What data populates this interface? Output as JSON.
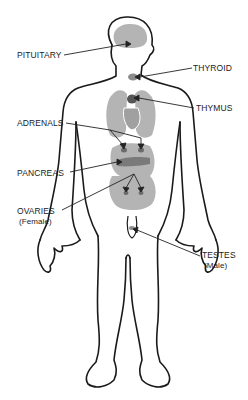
{
  "diagram": {
    "colors": {
      "outline": "#1a1a1a",
      "organ_light": "#b4b4b4",
      "organ_mid": "#8c8c8c",
      "gland_dark": "#555555",
      "leader": "#222222"
    },
    "labels": {
      "pituitary": "PITUITARY",
      "thyroid": "THYROID",
      "thymus": "THYMUS",
      "adrenals": "ADRENALS",
      "pancreas": "PANCREAS",
      "ovaries": "OVARIES",
      "ovaries_note": "(Female)",
      "testes": "TESTES",
      "testes_note": "(Male)"
    }
  }
}
